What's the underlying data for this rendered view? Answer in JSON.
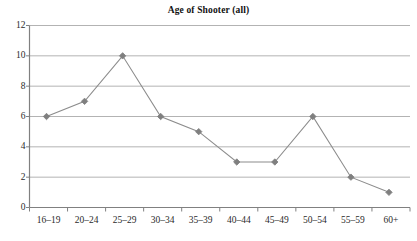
{
  "chart_data": {
    "type": "line",
    "title": "Age of Shooter (all)",
    "xlabel": "",
    "ylabel": "",
    "categories": [
      "16–19",
      "20–24",
      "25–29",
      "30–34",
      "35–39",
      "40–44",
      "45–49",
      "50–54",
      "55–59",
      "60+"
    ],
    "values": [
      6,
      7,
      10,
      6,
      5,
      3,
      3,
      6,
      2,
      1
    ],
    "series": [
      {
        "name": "Age of Shooter (all)",
        "values": [
          6,
          7,
          10,
          6,
          5,
          3,
          3,
          6,
          2,
          1
        ]
      }
    ],
    "ylim": [
      0,
      12
    ],
    "yticks": [
      0,
      2,
      4,
      6,
      8,
      10,
      12
    ],
    "ytick_labels": [
      "0",
      "2",
      "4",
      "6",
      "8",
      "10",
      "12"
    ],
    "grid": true,
    "grid_axis": "y",
    "legend": false,
    "legend_position": "none",
    "marker": "diamond",
    "colors": {
      "line": "#8c8c8c",
      "marker": "#7f7f7f",
      "grid": "#b3b3b3",
      "axis": "#808080",
      "text": "#2b2b2b",
      "background": "#ffffff"
    }
  }
}
